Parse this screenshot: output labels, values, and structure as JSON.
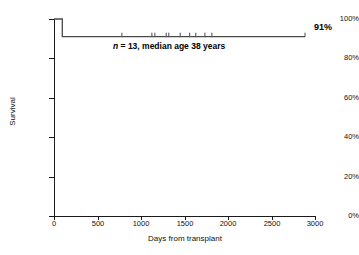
{
  "chart_data": {
    "type": "line",
    "subtype": "kaplan-meier-survival",
    "title": "",
    "xlabel": "Days from transplant",
    "ylabel": "Survival",
    "xlim": [
      0,
      3000
    ],
    "ylim": [
      0,
      100
    ],
    "xticks": [
      0,
      500,
      1000,
      1500,
      2000,
      2500,
      3000
    ],
    "xticklabels": [
      "0",
      "500",
      "1000",
      "1500",
      "2000",
      "2500",
      "3000"
    ],
    "yticks": [
      0,
      20,
      40,
      60,
      80,
      100
    ],
    "yticklabels": [
      "0%",
      "20%",
      "40%",
      "60%",
      "80%",
      "100%"
    ],
    "grid": false,
    "legend": false,
    "line_color": "#4a4a4a",
    "n": 13,
    "median_age_years": 38,
    "final_survival_percent": 91,
    "steps": [
      {
        "x": 0,
        "y": 100
      },
      {
        "x": 95,
        "y": 100
      },
      {
        "x": 95,
        "y": 91
      },
      {
        "x": 2885,
        "y": 91
      }
    ],
    "censor_times": [
      780,
      1125,
      1160,
      1290,
      1320,
      1450,
      1560,
      1630,
      1735,
      1815,
      2885
    ],
    "censor_y": 91,
    "annotation": "n = 13, median age 38 years",
    "annotation_n_symbol": "n",
    "annotation_rest": " = 13, median age 38 years",
    "end_label": "91%"
  },
  "figure": {
    "axis_color": "#1a1a1a",
    "background": "#ffffff"
  }
}
